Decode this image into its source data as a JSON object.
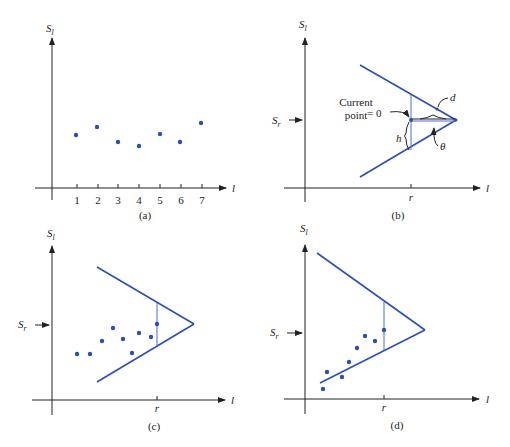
{
  "panels": {
    "a": {
      "caption": "(a)",
      "y_label": "S",
      "y_sub": "l",
      "x_label": "l",
      "ticks": [
        "1",
        "2",
        "3",
        "4",
        "5",
        "6",
        "7"
      ]
    },
    "b": {
      "caption": "(b)",
      "y_label": "S",
      "y_sub": "l",
      "x_label": "l",
      "sr_label": "S",
      "sr_sub": "r",
      "r_label": "r",
      "current_point_line1": "Current",
      "current_point_line2": "point",
      "eq_zero": "= 0",
      "d_label": "d",
      "h_label": "h",
      "theta_label": "θ"
    },
    "c": {
      "caption": "(c)",
      "y_label": "S",
      "y_sub": "l",
      "x_label": "l",
      "sr_label": "S",
      "sr_sub": "r",
      "r_label": "r"
    },
    "d": {
      "caption": "(d)",
      "y_label": "S",
      "y_sub": "l",
      "x_label": "l",
      "sr_label": "S",
      "sr_sub": "r",
      "r_label": "r"
    }
  },
  "colors": {
    "line": "#2b4fb5",
    "axis": "#222222"
  }
}
